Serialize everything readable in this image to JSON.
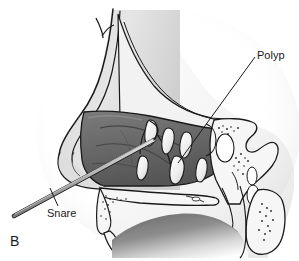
{
  "figure": {
    "panel_letter": "B",
    "background_color": "#ffffff",
    "line_color": "#1a1a1a"
  },
  "labels": {
    "polyp": "Polyp",
    "snare": "Snare"
  },
  "palette": {
    "background": "#ffffff",
    "outline": "#1a1a1a",
    "skin_light": "#e9e9e9",
    "skin_mid": "#cfcfcf",
    "cartilage": "#f4f4f4",
    "mucosa_dark": "#6e6e6e",
    "mucosa_darker": "#585858",
    "mucosa_mid": "#8a8a8a",
    "polyp_fill": "#f2f2f2",
    "bone_fill": "#f6f6f6",
    "bone_stipple": "#222222",
    "instrument_fill": "#b4b4b4",
    "instrument_shadow": "#7d7d7d",
    "shadow_wash": "#efefef",
    "tongue_light": "#fbfbfb",
    "tongue_dark": "#6b6b6b"
  },
  "anatomy": {
    "structures": [
      "nasal dorsum",
      "nasal tip",
      "columella",
      "nasal cavity mucosa",
      "superior turbinate",
      "middle turbinate",
      "inferior turbinate",
      "nasal polyps",
      "sphenoid sinus",
      "sphenoid bone",
      "hard palate",
      "soft palate",
      "tongue",
      "clivus",
      "cervical vertebra"
    ],
    "polyp_count": 6,
    "instrument": "wire snare introduced through nostril"
  },
  "leader_lines": {
    "polyp": {
      "from_x": 255,
      "from_y": 57,
      "to_x": 178,
      "to_y": 163
    },
    "snare": {
      "from_x": 58,
      "from_y": 205,
      "to_x": 50,
      "to_y": 188
    }
  }
}
